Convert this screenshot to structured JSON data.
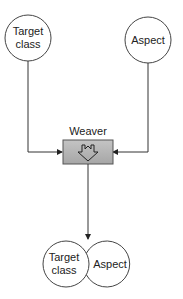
{
  "diagram": {
    "nodes": {
      "target_class_top": {
        "line1": "Target",
        "line2": "class"
      },
      "aspect_top": {
        "label": "Aspect"
      },
      "weaver": {
        "label": "Weaver",
        "icon": "down-arrow-icon",
        "fill": "#b3b3b3"
      },
      "target_class_result": {
        "line1": "Target",
        "line2": "class"
      },
      "aspect_result": {
        "label": "Aspect"
      }
    },
    "edges": [
      {
        "from": "Target class",
        "to": "Weaver"
      },
      {
        "from": "Aspect",
        "to": "Weaver"
      },
      {
        "from": "Weaver",
        "to": "Target class + Aspect"
      }
    ],
    "colors": {
      "stroke": "#333333",
      "box_fill": "#b3b3b3",
      "box_border": "#555555"
    }
  }
}
